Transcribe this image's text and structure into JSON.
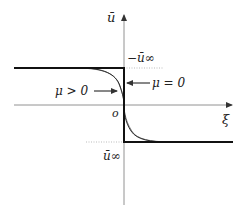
{
  "figure": {
    "type": "step profile diagram",
    "axes": {
      "vertical_label": "ū",
      "horizontal_label": "ξ",
      "origin_label": "o"
    },
    "levels": {
      "upper_label": "−ū∞",
      "lower_label": "ū∞"
    },
    "annotations": {
      "mu_zero": "μ = 0",
      "mu_positive": "μ > 0"
    },
    "colors": {
      "axis": "#555555",
      "step": "#111111",
      "curve": "#333333",
      "dotted": "#999999"
    }
  }
}
